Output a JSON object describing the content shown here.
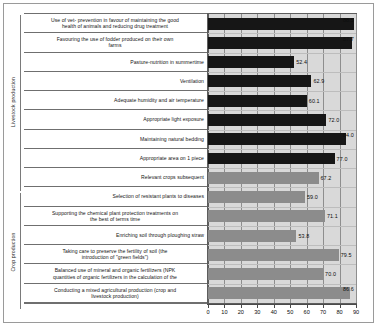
{
  "chart_data": {
    "type": "bar",
    "orientation": "horizontal",
    "title": "",
    "xlabel": "",
    "ylabel": "",
    "xlim": [
      0,
      90
    ],
    "xticks": [
      0,
      10,
      20,
      30,
      40,
      50,
      60,
      70,
      80,
      90
    ],
    "grid": true,
    "legend": "none",
    "group_axis_labels": [
      "Livestock production",
      "Crop production"
    ],
    "series": [
      {
        "name": "Livestock production",
        "color": "#161616",
        "categories": [
          "Use of vet- prevention in favour of maintaining the good health of animals and reducing drug treatment",
          "Favouring the use of fodder produced on their own farms",
          "Pasture-nutrition in summertime",
          "Ventilation",
          "Adequate humidity and air temperature",
          "Appropriate light exposure",
          "Maintaining natural bedding",
          "Appropriate area on 1 piece"
        ],
        "values": [
          88.5,
          87.7,
          52.4,
          62.9,
          60.1,
          72.0,
          84.0,
          77.0
        ]
      },
      {
        "name": "Crop production",
        "color": "#8c8c8c",
        "categories": [
          "Relevant crops subsequent",
          "Selection of resistant plants to diseases",
          "Supporting the chemical plant protection treatments on the best of terms time",
          "Enriching soil through ploughing straw",
          "Taking care to preserve the fertility of soil (the introduction of \"green fields\")",
          "Balanced use of mineral and organic fertilizers (NPK quantities of organic fertilizers in the calculation of the",
          "Conducting a mixed agricultural production (crop and livestock production)"
        ],
        "values": [
          67.2,
          59.0,
          71.1,
          53.8,
          79.5,
          70.0,
          86.6
        ]
      }
    ],
    "rows": [
      {
        "label_lines": [
          "Use of vet- prevention in favour of maintaining the good",
          "health of animals and reducing drug treatment"
        ],
        "value": 88.5,
        "value_text": "88.5",
        "group": "livestock"
      },
      {
        "label_lines": [
          "Favouring the use of fodder produced on their own",
          "farms"
        ],
        "value": 87.7,
        "value_text": "87.7",
        "group": "livestock"
      },
      {
        "label_lines": [
          "Pasture-nutrition in summertime"
        ],
        "value": 52.4,
        "value_text": "52.4",
        "group": "livestock"
      },
      {
        "label_lines": [
          "Ventilation"
        ],
        "value": 62.9,
        "value_text": "62.9",
        "group": "livestock"
      },
      {
        "label_lines": [
          "Adequate humidity and air temperature"
        ],
        "value": 60.1,
        "value_text": "60.1",
        "group": "livestock"
      },
      {
        "label_lines": [
          "Appropriate light exposure"
        ],
        "value": 72.0,
        "value_text": "72.0",
        "group": "livestock"
      },
      {
        "label_lines": [
          "Maintaining natural bedding"
        ],
        "value": 84.0,
        "value_text": "84.0",
        "group": "livestock"
      },
      {
        "label_lines": [
          "Appropriate area on 1 piece"
        ],
        "value": 77.0,
        "value_text": "77.0",
        "group": "livestock"
      },
      {
        "label_lines": [
          "Relevant crops subsequent"
        ],
        "value": 67.2,
        "value_text": "67.2",
        "group": "crop"
      },
      {
        "label_lines": [
          "Selection of resistant plants to diseases"
        ],
        "value": 59.0,
        "value_text": "59.0",
        "group": "crop"
      },
      {
        "label_lines": [
          "Supporting the chemical plant protection treatments on",
          "the best of terms time"
        ],
        "value": 71.1,
        "value_text": "71.1",
        "group": "crop"
      },
      {
        "label_lines": [
          "Enriching soil through ploughing straw"
        ],
        "value": 53.8,
        "value_text": "53.8",
        "group": "crop"
      },
      {
        "label_lines": [
          "Taking care to preserve the fertility of soil (the",
          "introduction of \"green fields\")"
        ],
        "value": 79.5,
        "value_text": "79.5",
        "group": "crop"
      },
      {
        "label_lines": [
          "Balanced use of mineral and organic fertilizers (NPK",
          "quantities of organic fertilizers in the calculation of the"
        ],
        "value": 70.0,
        "value_text": "70.0",
        "group": "crop"
      },
      {
        "label_lines": [
          "Conducting a mixed agricultural production (crop and",
          "livestock production)"
        ],
        "value": 86.6,
        "value_text": "86.6",
        "group": "crop"
      }
    ]
  }
}
